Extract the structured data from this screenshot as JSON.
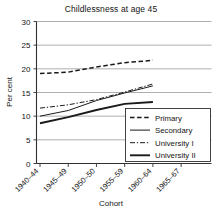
{
  "chart_data": {
    "type": "line",
    "title": "Childlessness at age 45",
    "xlabel": "Cohort",
    "ylabel": "Per cent",
    "categories": [
      "1940–44",
      "1945–49",
      "1950–50",
      "1955–59",
      "1960–64",
      "1965–67"
    ],
    "ylim": [
      0,
      30
    ],
    "yticks": [
      0,
      5,
      10,
      15,
      20,
      25,
      30
    ],
    "ytick_labels": [
      "0",
      "5",
      "10",
      "15",
      "20",
      "25",
      "30"
    ],
    "grid": true,
    "legend_position": "lower-right",
    "series": [
      {
        "name": "Primary",
        "style": "dashed",
        "values": [
          19.0,
          19.3,
          20.4,
          21.3,
          21.8,
          null
        ]
      },
      {
        "name": "Secondary",
        "style": "solid-thin",
        "values": [
          10.0,
          11.2,
          13.3,
          14.9,
          16.4,
          null
        ]
      },
      {
        "name": "University I",
        "style": "dash-dot",
        "values": [
          11.7,
          12.4,
          13.5,
          15.1,
          16.8,
          null
        ]
      },
      {
        "name": "University II",
        "style": "solid-thick",
        "values": [
          8.5,
          9.8,
          11.3,
          12.6,
          13.0,
          null
        ]
      }
    ]
  },
  "legend": {
    "entries": [
      "Primary",
      "Secondary",
      "University I",
      "University II"
    ]
  },
  "colors": {
    "line": "#1a1a1a",
    "grid": "#8c8c8c",
    "axis": "#303030",
    "background": "#ffffff"
  }
}
